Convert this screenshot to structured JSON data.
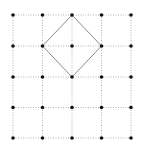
{
  "diagram": {
    "type": "dot-grid-with-square",
    "grid": {
      "columns": 5,
      "rows": 5,
      "x": [
        13,
        42.5,
        72,
        101.5,
        131
      ],
      "y": [
        15,
        46,
        77,
        107.5,
        138
      ],
      "line_color": "#b0b0b0",
      "line_style": "dotted",
      "dot_color": "#111111",
      "dot_radius": 1.8
    },
    "shape": {
      "name": "square rotated 45 degrees",
      "vertices_grid": [
        [
          2,
          0
        ],
        [
          3,
          1
        ],
        [
          2,
          2
        ],
        [
          1,
          1
        ]
      ],
      "stroke_color": "#8a8a8a",
      "stroke_width": 1
    }
  }
}
